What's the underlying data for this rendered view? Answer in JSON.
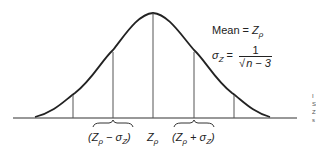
{
  "diagram": {
    "type": "normal-distribution",
    "annotations": {
      "mean_label": "Mean =",
      "mean_symbol": "Z",
      "mean_subscript": "ρ",
      "sigma_symbol": "σ",
      "sigma_subscript": "Z",
      "equals": "=",
      "fraction_numerator": "1",
      "fraction_radical": "√",
      "fraction_denominator": "n − 3"
    },
    "axis_labels": {
      "left": "(Z",
      "left_sub": "ρ",
      "left_rest": " − σ",
      "left_sub2": "Z",
      "left_close": ")",
      "center": "Z",
      "center_sub": "ρ",
      "right": "(Z",
      "right_sub": "ρ",
      "right_rest": " + σ",
      "right_sub2": "Z",
      "right_close": ")"
    },
    "side_text": [
      "I",
      "S",
      "Z",
      "s"
    ],
    "colors": {
      "curve": "#222222",
      "axis": "#333333",
      "lines": "#555555"
    }
  }
}
